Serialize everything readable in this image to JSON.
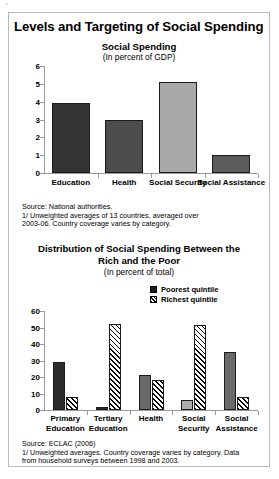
{
  "artifact_mark": "↑",
  "main_title": "Levels and Targeting of Social Spending",
  "chart_data": [
    {
      "type": "bar",
      "title": "Social Spending",
      "subtitle": "(In percent of GDP)",
      "xlabel": "",
      "ylabel": "",
      "ylim": [
        0,
        6
      ],
      "yticks": [
        "0",
        "1",
        "2",
        "3",
        "4",
        "5",
        "6"
      ],
      "grid": false,
      "legend": "none",
      "categories": [
        "Education",
        "Health",
        "Social Security",
        "Social Assistance"
      ],
      "values": [
        3.95,
        3.0,
        5.1,
        1.0
      ],
      "bar_colors": [
        "#333333",
        "#4d4d4d",
        "#a8a8a8",
        "#5c5c5c"
      ],
      "source": "Source: National authorities.\n1/ Unweighted averages of 13 countries, averaged over\n2003-06. Country coverage varies by category."
    },
    {
      "type": "bar",
      "title": "Distribution of Social Spending Between the\nRich and the Poor",
      "subtitle": "(In percent of total)",
      "xlabel": "",
      "ylabel": "",
      "ylim": [
        0,
        60
      ],
      "yticks": [
        "0",
        "10",
        "20",
        "30",
        "40",
        "50",
        "60"
      ],
      "grid": false,
      "legend": "top-right",
      "categories": [
        "Primary\nEducation",
        "Tertiary\nEducation",
        "Health",
        "Social\nSecurity",
        "Social\nAssistance"
      ],
      "series": [
        {
          "name": "Poorest quintile",
          "values": [
            29,
            2,
            21,
            6,
            35
          ],
          "colors": [
            "#2b2b2b",
            "#2b2b2b",
            "#6a6a6a",
            "#ababab",
            "#6a6a6a"
          ]
        },
        {
          "name": "Richest quintile",
          "values": [
            8,
            52,
            18,
            51.5,
            8
          ],
          "pattern": "diagonal-hatch"
        }
      ],
      "source": "Source: ECLAC (2006)\n1/ Unweighted averages. Country coverage varies by category. Data\nfrom household surveys between 1998 and 2003."
    }
  ]
}
